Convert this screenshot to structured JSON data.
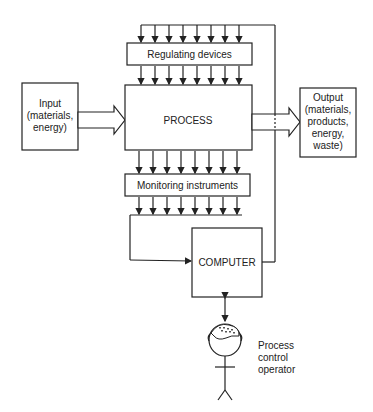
{
  "diagram": {
    "regulating": "Regulating devices",
    "process": "PROCESS",
    "monitoring": "Monitoring instruments",
    "computer": "COMPUTER",
    "input": [
      "Input",
      "(materials,",
      "energy)"
    ],
    "output": [
      "Output",
      "(materials,",
      "products,",
      "energy,",
      "waste)"
    ],
    "operator": [
      "Process",
      "control",
      "operator"
    ],
    "signal_lines": 8
  }
}
